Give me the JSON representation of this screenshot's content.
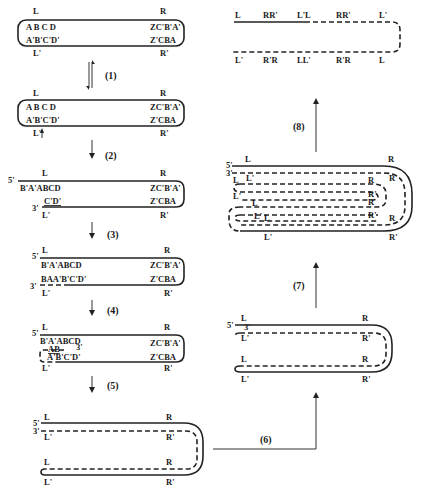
{
  "diagram": {
    "stage0": {
      "top_left": "L",
      "top_right": "R",
      "inner_top_left": "A B C D",
      "inner_top_right": "ZC'B'A'",
      "inner_bottom_left": "A'B'C'D'",
      "inner_bottom_right": "Z'CBA",
      "bottom_left": "L'",
      "bottom_right": "R'"
    },
    "step1": "(1)",
    "stage1": {
      "top_left": "L",
      "top_right": "R",
      "inner_top_left": "A B C D",
      "inner_top_right": "ZC'B'A'",
      "inner_bottom_left": "A'B'C'D'",
      "inner_bottom_right": "Z'CBA",
      "bottom_left": "L'",
      "bottom_right": "R'"
    },
    "step2": "(2)",
    "stage2": {
      "five_prime": "5'",
      "three_prime": "3'",
      "top_left": "L",
      "top_right": "R",
      "inner_top_left": "B'A'ABCD",
      "inner_top_right": "ZC'B'A'",
      "inner_bottom_left": "C'D'",
      "inner_bottom_right": "Z'CBA",
      "bottom_left": "L'",
      "bottom_right": "R'"
    },
    "step3": "(3)",
    "stage3": {
      "five_prime": "5'",
      "three_prime": "3'",
      "top_left": "L",
      "top_right": "R",
      "inner_top_left": "B'A'ABCD",
      "inner_top_right": "ZC'B'A'",
      "inner_bottom_left": "BAA'B'C'D'",
      "inner_bottom_right": "Z'CBA",
      "bottom_left": "L'",
      "bottom_right": "R'"
    },
    "step4": "(4)",
    "stage4": {
      "five_prime": "5'",
      "three_prime": "3'",
      "top_left": "L",
      "top_right": "R",
      "inner_top_left": "B'A'ABCD",
      "inner_top_right": "ZC'B'A'",
      "loop_label": "AB",
      "inner_bottom_left": "A'B'C'D'",
      "inner_bottom_right": "Z'CBA",
      "bottom_left": "L'",
      "bottom_right": "R'"
    },
    "step5": "(5)",
    "stage5": {
      "five_prime": "5'",
      "three_prime": "3'",
      "top_left": "L",
      "top_right": "R",
      "upper_inner_left": "L'",
      "upper_inner_right": "R'",
      "lower_inner_left": "L",
      "lower_inner_right": "R",
      "bottom_left": "L'",
      "bottom_right": "R'"
    },
    "step6": "(6)",
    "stage6": {
      "five_prime": "5'",
      "three_prime": "3'",
      "top_left": "L",
      "top_right": "R",
      "upper_inner_left": "L'",
      "upper_inner_right": "R'",
      "lower_inner_left": "L",
      "lower_inner_right": "R",
      "bottom_left": "L'",
      "bottom_right": "R'"
    },
    "step7": "(7)",
    "stage7": {
      "five_prime": "5'",
      "three_prime": "3'",
      "labels": {
        "top_left": "L",
        "top_right": "R",
        "l1_left": "L'",
        "l1_right": "R'",
        "l2_left": "L",
        "l2_right": "R",
        "l3_left": "L'",
        "l3_right": "R'",
        "l4_right": "R",
        "l5_left": "L",
        "l5_right": "R'",
        "l6_left_a": "L'",
        "l6_left_b": "L",
        "l6_right": "R",
        "bottom_left": "L'",
        "bottom_right": "R'"
      }
    },
    "step8": "(8)",
    "stage8": {
      "top_labels": [
        "L",
        "RR'",
        "L'L",
        "RR'",
        "L'"
      ],
      "bottom_labels": [
        "L'",
        "R'R",
        "LL'",
        "R'R",
        "L"
      ]
    }
  }
}
